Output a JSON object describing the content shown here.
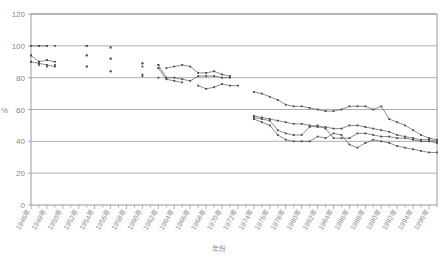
{
  "chart_data": {
    "type": "line",
    "title": "",
    "xlabel": "年份",
    "ylabel": "%",
    "ylim": [
      0,
      120
    ],
    "ytick_values": [
      0,
      20,
      40,
      60,
      80,
      100,
      120
    ],
    "ytick_labels": [
      "0",
      "20",
      "40",
      "60",
      "80",
      "100",
      "120"
    ],
    "grid": true,
    "legend": "none",
    "x_start_year": 1946,
    "x_end_year": 1997,
    "xtick_labels": [
      "1946年",
      "1948年",
      "1950年",
      "1952年",
      "1954年",
      "1956年",
      "1958年",
      "1960年",
      "1962年",
      "1964年",
      "1966年",
      "1968年",
      "1970年",
      "1972年",
      "1974年",
      "1976年",
      "1978年",
      "1980年",
      "1982年",
      "1984年",
      "1986年",
      "1988年",
      "1990年",
      "1992年",
      "1994年",
      "1996年"
    ],
    "series": [
      {
        "name": "series-1",
        "marker": "square",
        "points": [
          [
            1946,
            100
          ],
          [
            1947,
            100
          ],
          [
            1948,
            100
          ],
          [
            1953,
            100
          ],
          [
            1956,
            99
          ],
          [
            1963,
            86
          ],
          [
            1964,
            87
          ],
          [
            1965,
            88
          ],
          [
            1966,
            87
          ],
          [
            1967,
            83
          ],
          [
            1968,
            83
          ],
          [
            1969,
            84
          ],
          [
            1970,
            82
          ],
          [
            1971,
            81
          ],
          [
            1974,
            71
          ],
          [
            1975,
            70
          ],
          [
            1976,
            68
          ],
          [
            1977,
            66
          ],
          [
            1978,
            63
          ],
          [
            1979,
            62
          ],
          [
            1980,
            62
          ],
          [
            1981,
            61
          ],
          [
            1982,
            60
          ],
          [
            1983,
            59
          ],
          [
            1984,
            59
          ],
          [
            1985,
            60
          ],
          [
            1986,
            62
          ],
          [
            1987,
            62
          ],
          [
            1988,
            62
          ],
          [
            1989,
            60
          ],
          [
            1990,
            62
          ],
          [
            1991,
            54
          ],
          [
            1992,
            52
          ],
          [
            1993,
            50
          ],
          [
            1994,
            47
          ],
          [
            1995,
            44
          ],
          [
            1996,
            42
          ],
          [
            1997,
            41
          ]
        ]
      },
      {
        "name": "series-2",
        "marker": "square",
        "points": [
          [
            1946,
            94
          ],
          [
            1947,
            90
          ],
          [
            1948,
            91
          ],
          [
            1949,
            90
          ],
          [
            1953,
            94
          ],
          [
            1956,
            92
          ],
          [
            1960,
            89
          ],
          [
            1962,
            88
          ],
          [
            1963,
            80
          ],
          [
            1964,
            80
          ],
          [
            1965,
            79
          ],
          [
            1966,
            78
          ],
          [
            1967,
            81
          ],
          [
            1968,
            81
          ],
          [
            1969,
            81
          ],
          [
            1970,
            80
          ],
          [
            1971,
            80
          ],
          [
            1974,
            56
          ],
          [
            1975,
            55
          ],
          [
            1976,
            54
          ],
          [
            1977,
            53
          ],
          [
            1978,
            52
          ],
          [
            1979,
            51
          ],
          [
            1980,
            51
          ],
          [
            1981,
            50
          ],
          [
            1982,
            49
          ],
          [
            1983,
            49
          ],
          [
            1984,
            48
          ],
          [
            1985,
            48
          ],
          [
            1986,
            50
          ],
          [
            1987,
            50
          ],
          [
            1988,
            49
          ],
          [
            1989,
            48
          ],
          [
            1990,
            47
          ],
          [
            1991,
            46
          ],
          [
            1992,
            44
          ],
          [
            1993,
            43
          ],
          [
            1994,
            42
          ],
          [
            1995,
            41
          ],
          [
            1996,
            41
          ],
          [
            1997,
            40
          ]
        ]
      },
      {
        "name": "series-3",
        "marker": "square",
        "points": [
          [
            1946,
            90
          ],
          [
            1947,
            89
          ],
          [
            1948,
            88
          ],
          [
            1949,
            87
          ],
          [
            1953,
            87
          ],
          [
            1956,
            84
          ],
          [
            1960,
            82
          ],
          [
            1962,
            86
          ],
          [
            1963,
            79
          ],
          [
            1964,
            78
          ],
          [
            1965,
            77
          ],
          [
            1967,
            75
          ],
          [
            1968,
            73
          ],
          [
            1969,
            74
          ],
          [
            1970,
            76
          ],
          [
            1971,
            75
          ],
          [
            1972,
            75
          ],
          [
            1974,
            55
          ],
          [
            1975,
            54
          ],
          [
            1976,
            53
          ],
          [
            1977,
            47
          ],
          [
            1978,
            45
          ],
          [
            1979,
            44
          ],
          [
            1980,
            44
          ],
          [
            1981,
            49
          ],
          [
            1982,
            50
          ],
          [
            1983,
            48
          ],
          [
            1984,
            42
          ],
          [
            1985,
            42
          ],
          [
            1986,
            42
          ],
          [
            1987,
            45
          ],
          [
            1988,
            45
          ],
          [
            1989,
            44
          ],
          [
            1990,
            43
          ],
          [
            1991,
            43
          ],
          [
            1992,
            42
          ],
          [
            1993,
            42
          ],
          [
            1994,
            41
          ],
          [
            1995,
            40
          ],
          [
            1996,
            40
          ],
          [
            1997,
            39
          ]
        ]
      },
      {
        "name": "series-4",
        "marker": "square",
        "points": [
          [
            1974,
            54
          ],
          [
            1975,
            52
          ],
          [
            1976,
            50
          ],
          [
            1977,
            44
          ],
          [
            1978,
            41
          ],
          [
            1979,
            40
          ],
          [
            1980,
            40
          ],
          [
            1981,
            40
          ],
          [
            1982,
            43
          ],
          [
            1983,
            42
          ],
          [
            1984,
            45
          ],
          [
            1985,
            44
          ],
          [
            1986,
            38
          ],
          [
            1987,
            36
          ],
          [
            1988,
            39
          ],
          [
            1989,
            41
          ],
          [
            1990,
            40
          ],
          [
            1991,
            39
          ],
          [
            1992,
            37
          ],
          [
            1993,
            36
          ],
          [
            1994,
            35
          ],
          [
            1995,
            34
          ],
          [
            1996,
            33
          ],
          [
            1997,
            33
          ]
        ]
      }
    ],
    "scatter_points": [
      [
        1946,
        94
      ],
      [
        1946,
        90
      ],
      [
        1947,
        100
      ],
      [
        1947,
        90
      ],
      [
        1947,
        88
      ],
      [
        1948,
        100
      ],
      [
        1948,
        91
      ],
      [
        1948,
        87
      ],
      [
        1949,
        100
      ],
      [
        1949,
        88
      ],
      [
        1953,
        100
      ],
      [
        1953,
        94
      ],
      [
        1953,
        87
      ],
      [
        1956,
        99
      ],
      [
        1956,
        92
      ],
      [
        1956,
        84
      ],
      [
        1960,
        89
      ],
      [
        1960,
        87
      ],
      [
        1960,
        81
      ],
      [
        1962,
        88
      ],
      [
        1962,
        86
      ],
      [
        1962,
        80
      ]
    ]
  }
}
